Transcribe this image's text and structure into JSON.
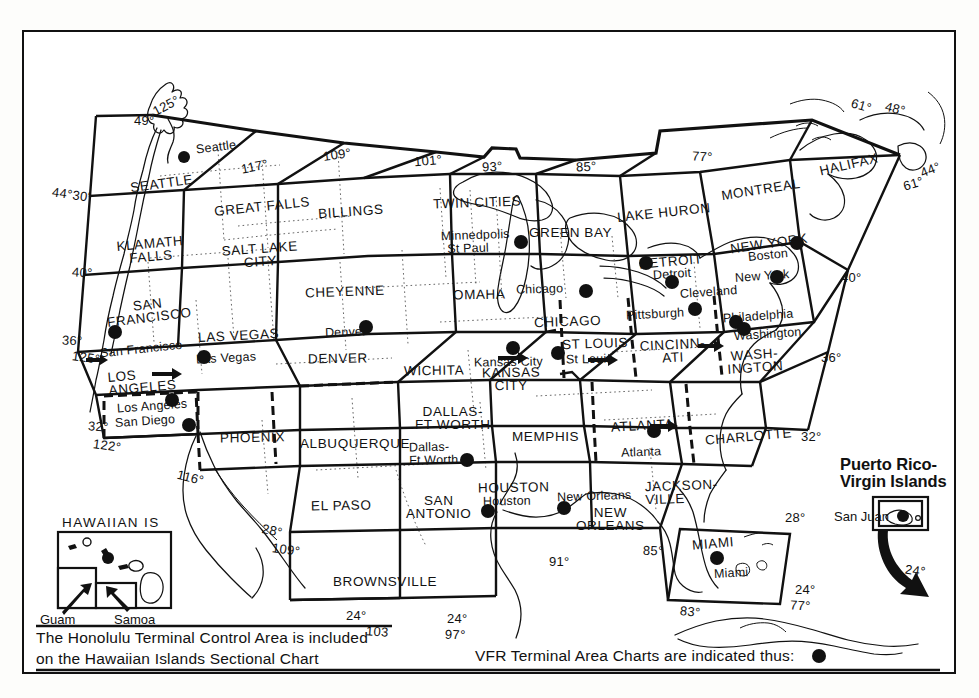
{
  "document": {
    "title": "Sectional Aeronautical Chart Index - Conterminous United States"
  },
  "zones": [
    {
      "id": "seattle",
      "label": "SEATTLE",
      "x": 162,
      "y": 176,
      "rot": -7
    },
    {
      "id": "great-falls",
      "label": "GREAT FALLS",
      "x": 258,
      "y": 194,
      "rot": -5
    },
    {
      "id": "billings",
      "label": "BILLINGS",
      "x": 352,
      "y": 211,
      "rot": -3
    },
    {
      "id": "twin-cities",
      "label": "TWIN CITIES",
      "x": 432,
      "y": 202,
      "rot": -1
    },
    {
      "id": "green-bay",
      "label": "GREEN BAY",
      "x": 528,
      "y": 218,
      "rot": 0
    },
    {
      "id": "lake-huron",
      "label": "LAKE HURON",
      "x": 615,
      "y": 214,
      "rot": -4
    },
    {
      "id": "montreal",
      "label": "MONTREAL",
      "x": 725,
      "y": 184,
      "rot": -7
    },
    {
      "id": "halifax",
      "label": "HALIFAX",
      "x": 820,
      "y": 156,
      "rot": -11
    },
    {
      "id": "klamath-falls",
      "label": "KLAMATH",
      "label2": "FALLS",
      "x": 147,
      "y": 238,
      "rot": -4
    },
    {
      "id": "salt-lake-city",
      "label": "SALT LAKE",
      "label2": "CITY",
      "x": 243,
      "y": 243,
      "rot": -3
    },
    {
      "id": "cheyenne",
      "label": "CHEYENNE",
      "x": 337,
      "y": 280,
      "rot": -1
    },
    {
      "id": "omaha",
      "label": "OMAHA",
      "x": 452,
      "y": 284,
      "rot": -1
    },
    {
      "id": "chicago",
      "label": "CHICAGO",
      "x": 546,
      "y": 318,
      "rot": -1
    },
    {
      "id": "detroit",
      "label": "DETROIT",
      "x": 650,
      "y": 259,
      "rot": -4
    },
    {
      "id": "new-york",
      "label": "NEW YORK",
      "x": 733,
      "y": 240,
      "rot": -6
    },
    {
      "id": "san-francisco",
      "label": "SAN",
      "label2": "FRANCISCO",
      "x": 113,
      "y": 301,
      "rot": -5
    },
    {
      "id": "las-vegas",
      "label": "LAS VEGAS",
      "x": 204,
      "y": 328,
      "rot": -2
    },
    {
      "id": "denver",
      "label": "DENVER",
      "x": 308,
      "y": 355,
      "rot": 0
    },
    {
      "id": "wichita",
      "label": "WICHITA",
      "x": 404,
      "y": 366,
      "rot": 0
    },
    {
      "id": "kansas-city",
      "label": "KANSAS",
      "label2": "CITY",
      "x": 490,
      "y": 375,
      "rot": 0
    },
    {
      "id": "st-louis",
      "label": "ST LOUIS",
      "x": 565,
      "y": 341,
      "rot": -2
    },
    {
      "id": "cincinnati",
      "label": "CINCINN-",
      "label2": "ATI",
      "x": 652,
      "y": 342,
      "rot": -2
    },
    {
      "id": "washington",
      "label": "WASH-",
      "label2": "INGTON",
      "x": 735,
      "y": 350,
      "rot": -3
    },
    {
      "id": "los-angeles",
      "label": "LOS",
      "label2": "ANGELES",
      "x": 112,
      "y": 371,
      "rot": -4
    },
    {
      "id": "phoenix",
      "label": "PHOENIX",
      "x": 227,
      "y": 432,
      "rot": -1
    },
    {
      "id": "albuquerque",
      "label": "ALBUQUERQUE",
      "x": 311,
      "y": 438,
      "rot": 0
    },
    {
      "id": "dallas-ft-worth",
      "label": "DALLAS-",
      "label2": "FT WORTH",
      "x": 428,
      "y": 410,
      "rot": 0
    },
    {
      "id": "memphis",
      "label": "MEMPHIS",
      "x": 520,
      "y": 434,
      "rot": 0
    },
    {
      "id": "atlanta",
      "label": "ATLANTA",
      "x": 617,
      "y": 424,
      "rot": -2
    },
    {
      "id": "charlotte",
      "label": "CHARLOTTE",
      "x": 709,
      "y": 434,
      "rot": -4
    },
    {
      "id": "el-paso",
      "label": "EL PASO",
      "x": 316,
      "y": 505,
      "rot": 0
    },
    {
      "id": "san-antonio",
      "label": "SAN",
      "label2": "ANTONIO",
      "x": 412,
      "y": 500,
      "rot": 0
    },
    {
      "id": "houston",
      "label": "HOUSTON",
      "x": 482,
      "y": 485,
      "rot": 0
    },
    {
      "id": "new-orleans",
      "label": "NEW",
      "label2": "ORLEANS",
      "x": 588,
      "y": 511,
      "rot": 0
    },
    {
      "id": "jacksonville",
      "label": "JACKSON-",
      "label2": "VILLE",
      "x": 655,
      "y": 483,
      "rot": -1
    },
    {
      "id": "miami",
      "label": "MIAMI",
      "x": 695,
      "y": 541,
      "rot": -3
    },
    {
      "id": "brownsville",
      "label": "BROWNSVILLE",
      "x": 382,
      "y": 580,
      "rot": 0
    }
  ],
  "cities": [
    {
      "name": "Seattle",
      "label_x": 192,
      "label_y": 142,
      "dot_x": 184,
      "dot_y": 157,
      "rot": -6
    },
    {
      "name": "Minnedpolis",
      "label_x": 440,
      "label_y": 228,
      "dot_x": 521,
      "dot_y": 242,
      "rot": -1,
      "second": "St Paul"
    },
    {
      "name": "Chicago",
      "label_x": 513,
      "label_y": 286,
      "dot_x": 586,
      "dot_y": 291,
      "rot": -1
    },
    {
      "name": "Detroit",
      "label_x": 650,
      "label_y": 268,
      "dot_x": 646,
      "dot_y": 263,
      "rot": -3
    },
    {
      "name": "Cleveland",
      "label_x": 677,
      "label_y": 286,
      "dot_x": 672,
      "dot_y": 282,
      "rot": -3
    },
    {
      "name": "Boston",
      "label_x": 748,
      "label_y": 252,
      "dot_x": 797,
      "dot_y": 243,
      "rot": -4
    },
    {
      "name": "New York",
      "label_x": 737,
      "label_y": 273,
      "dot_x": 777,
      "dot_y": 277,
      "rot": -3
    },
    {
      "name": "Pittsburgh",
      "label_x": 624,
      "label_y": 311,
      "dot_x": 695,
      "dot_y": 309,
      "rot": -2
    },
    {
      "name": "Philadelphia",
      "label_x": 722,
      "label_y": 313,
      "dot_x": 736,
      "dot_y": 322,
      "rot": -3
    },
    {
      "name": "Washington",
      "label_x": 735,
      "label_y": 334,
      "dot_x": 744,
      "dot_y": 329,
      "rot": -3
    },
    {
      "name": "Denver",
      "label_x": 322,
      "label_y": 329,
      "dot_x": 366,
      "dot_y": 327,
      "rot": -1
    },
    {
      "name": "Kansas City",
      "label_x": 478,
      "label_y": 358,
      "dot_x": 513,
      "dot_y": 348,
      "rot": 0
    },
    {
      "name": "St Louis",
      "label_x": 563,
      "label_y": 357,
      "dot_x": 558,
      "dot_y": 353,
      "rot": 0
    },
    {
      "name": "San Francisco",
      "label_x": 103,
      "label_y": 345,
      "dot_x": 115,
      "dot_y": 332,
      "rot": -4
    },
    {
      "name": "Las Vegas",
      "label_x": 199,
      "label_y": 354,
      "dot_x": 204,
      "dot_y": 357,
      "rot": -2
    },
    {
      "name": "Los Angeles",
      "label_x": 118,
      "label_y": 404,
      "dot_x": 172,
      "dot_y": 400,
      "rot": -3
    },
    {
      "name": "San Diego",
      "label_x": 118,
      "label_y": 419,
      "dot_x": 189,
      "dot_y": 425,
      "rot": -3
    },
    {
      "name": "Dallas-",
      "label_x": 412,
      "label_y": 443,
      "dot_x": 467,
      "dot_y": 460,
      "rot": 0,
      "second": "Ft Worth"
    },
    {
      "name": "Atlanta",
      "label_x": 620,
      "label_y": 448,
      "dot_x": 654,
      "dot_y": 431,
      "rot": -1
    },
    {
      "name": "Houston",
      "label_x": 485,
      "label_y": 498,
      "dot_x": 488,
      "dot_y": 511,
      "rot": 0
    },
    {
      "name": "New Orleans",
      "label_x": 559,
      "label_y": 493,
      "dot_x": 564,
      "dot_y": 508,
      "rot": -1
    },
    {
      "name": "Miami",
      "label_x": 716,
      "label_y": 570,
      "dot_x": 717,
      "dot_y": 558,
      "rot": -2
    }
  ],
  "coordinates": [
    {
      "text": "49°",
      "x": 134,
      "y": 114,
      "rot": 0
    },
    {
      "text": "125°",
      "x": 152,
      "y": 101,
      "rot": 22
    },
    {
      "text": "117°",
      "x": 243,
      "y": 160,
      "rot": 12
    },
    {
      "text": "109°",
      "x": 326,
      "y": 148,
      "rot": 8
    },
    {
      "text": "101°",
      "x": 416,
      "y": 154,
      "rot": 4
    },
    {
      "text": "93°",
      "x": 484,
      "y": 160,
      "rot": 2
    },
    {
      "text": "85°",
      "x": 578,
      "y": 160,
      "rot": 2
    },
    {
      "text": "77°",
      "x": 694,
      "y": 149,
      "rot": -4
    },
    {
      "text": "61°",
      "x": 853,
      "y": 100,
      "rot": -16
    },
    {
      "text": "48°",
      "x": 887,
      "y": 103,
      "rot": -14
    },
    {
      "text": "44°",
      "x": 922,
      "y": 164,
      "rot": 18
    },
    {
      "text": "61°",
      "x": 906,
      "y": 178,
      "rot": 12
    },
    {
      "text": "44°30'",
      "x": 55,
      "y": 189,
      "rot": -8
    },
    {
      "text": "40°",
      "x": 74,
      "y": 267,
      "rot": -4
    },
    {
      "text": "40°",
      "x": 843,
      "y": 272,
      "rot": 0
    },
    {
      "text": "36°",
      "x": 64,
      "y": 335,
      "rot": -2
    },
    {
      "text": "125°",
      "x": 74,
      "y": 352,
      "rot": -8
    },
    {
      "text": "36°",
      "x": 823,
      "y": 352,
      "rot": 0
    },
    {
      "text": "32°",
      "x": 90,
      "y": 421,
      "rot": -4
    },
    {
      "text": "122°",
      "x": 95,
      "y": 440,
      "rot": -8
    },
    {
      "text": "32°",
      "x": 803,
      "y": 431,
      "rot": 0
    },
    {
      "text": "116°",
      "x": 179,
      "y": 472,
      "rot": -14
    },
    {
      "text": "28°",
      "x": 264,
      "y": 525,
      "rot": -12
    },
    {
      "text": "109°",
      "x": 274,
      "y": 544,
      "rot": -8
    },
    {
      "text": "28°",
      "x": 787,
      "y": 512,
      "rot": 0
    },
    {
      "text": "91°",
      "x": 551,
      "y": 556,
      "rot": 0
    },
    {
      "text": "85°",
      "x": 645,
      "y": 545,
      "rot": -2
    },
    {
      "text": "24°",
      "x": 797,
      "y": 584,
      "rot": 0
    },
    {
      "text": "77°",
      "x": 792,
      "y": 600,
      "rot": -4
    },
    {
      "text": "83°",
      "x": 682,
      "y": 606,
      "rot": -6
    },
    {
      "text": "24°",
      "x": 348,
      "y": 610,
      "rot": 0
    },
    {
      "text": "103",
      "x": 368,
      "y": 626,
      "rot": -4
    },
    {
      "text": "24°",
      "x": 449,
      "y": 613,
      "rot": 0
    },
    {
      "text": "97°",
      "x": 447,
      "y": 629,
      "rot": -2
    },
    {
      "text": "24°",
      "x": 907,
      "y": 565,
      "rot": -8
    }
  ],
  "hawaii_inset": {
    "title": "HAWAIIAN IS",
    "guam_label": "Guam",
    "samoa_label": "Samoa"
  },
  "puerto_rico_inset": {
    "title_line1": "Puerto Rico-",
    "title_line2": "Virgin Islands",
    "city": "San Juan"
  },
  "notes": {
    "hawaii_note_line1": "The Honolulu Terminal Control Area is included",
    "hawaii_note_line2": "on the Hawaiian Islands Sectional Chart",
    "tac_note": "VFR Terminal Area Charts are indicated thus:"
  },
  "colors": {
    "ink": "#111111",
    "paper": "#ffffff"
  }
}
